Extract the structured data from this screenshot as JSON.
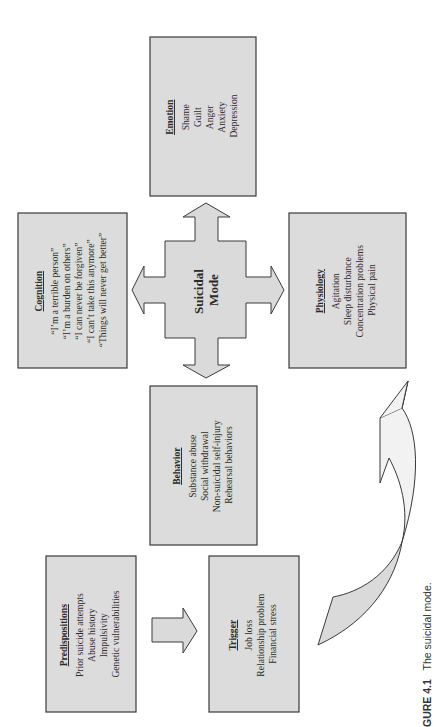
{
  "figure": {
    "orientation": "rotated 90 degrees counter-clockwise",
    "caption_label": "GURE 4.1",
    "caption_text": "The suicidal mode.",
    "colors": {
      "box_fill": "#dcdcdc",
      "border": "#3a3a3a",
      "text": "#2a2a2a",
      "background": "#ffffff"
    }
  },
  "center": {
    "line1": "Suicidal",
    "line2": "Mode"
  },
  "boxes": {
    "cognition": {
      "title": "Cognition",
      "items": [
        "“I’m a terrible person”",
        "“I’m a burden on others”",
        "“I can never be forgiven”",
        "“I can’t take this anymore”",
        "“Things will never get better”"
      ]
    },
    "emotion": {
      "title": "Emotion",
      "items": [
        "Shame",
        "Guilt",
        "Anger",
        "Anxiety",
        "Depression"
      ]
    },
    "physiology": {
      "title": "Physiology",
      "items": [
        "Agitation",
        "Sleep disturbance",
        "Concentration problems",
        "Physical pain"
      ]
    },
    "behavior": {
      "title": "Behavior",
      "items": [
        "Substance abuse",
        "Social withdrawal",
        "Non-suicidal self-injury",
        "Rehearsal behaviors"
      ]
    },
    "predispositions": {
      "title": "Predispositions",
      "items": [
        "Prior suicide attempts",
        "Abuse history",
        "Impulsivity",
        "Genetic vulnerabilities"
      ]
    },
    "trigger": {
      "title": "Trigger",
      "items": [
        "Job loss",
        "Relationship problem",
        "Financial stress"
      ]
    }
  }
}
